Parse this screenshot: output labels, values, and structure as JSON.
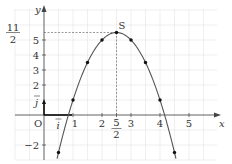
{
  "chart_data": {
    "type": "line",
    "title": "",
    "function": "f(x) = -2(x - 5/2)^2 + 11/2",
    "xlabel": "x",
    "ylabel": "y",
    "xlim": [
      -1,
      6
    ],
    "ylim": [
      -3,
      7
    ],
    "grid": true,
    "origin_label": "O",
    "unit_vectors": {
      "i": "i",
      "j": "j"
    },
    "x_ticks": [
      {
        "value": 1,
        "label": "1"
      },
      {
        "value": 2,
        "label": "2"
      },
      {
        "value": 3,
        "label": "3"
      },
      {
        "value": 4,
        "label": "4"
      },
      {
        "value": 5,
        "label": "5"
      }
    ],
    "x_special_tick": {
      "value": 2.5,
      "num": "5",
      "den": "2"
    },
    "y_ticks": [
      {
        "value": -2,
        "label": "−2"
      },
      {
        "value": 2,
        "label": "2"
      },
      {
        "value": 3,
        "label": "3"
      },
      {
        "value": 4,
        "label": "4"
      },
      {
        "value": 5,
        "label": "5"
      }
    ],
    "y_special_tick": {
      "value": 5.5,
      "num": "11",
      "den": "2"
    },
    "vertex": {
      "label": "S",
      "x": 2.5,
      "y": 5.5
    },
    "points": [
      {
        "x": 0.5,
        "y": -2.5
      },
      {
        "x": 1,
        "y": 1
      },
      {
        "x": 1.5,
        "y": 3.5
      },
      {
        "x": 2,
        "y": 5
      },
      {
        "x": 2.5,
        "y": 5.5
      },
      {
        "x": 3,
        "y": 5
      },
      {
        "x": 3.5,
        "y": 3.5
      },
      {
        "x": 4,
        "y": 1
      },
      {
        "x": 4.5,
        "y": -2.5
      }
    ],
    "colors": {
      "curve": "#555555",
      "grid": "#e4e4e4",
      "axis": "#444444"
    }
  }
}
